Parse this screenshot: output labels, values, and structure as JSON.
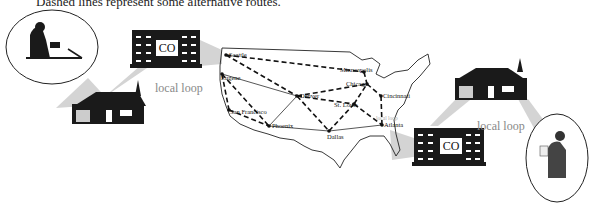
{
  "caption": "Dashed lines represent some alternative routes.",
  "labels": {
    "local_loop_left": "local loop",
    "local_loop_right": "local loop",
    "local_loop_map": "local loop",
    "co_left": "CO",
    "co_right": "CO"
  },
  "cities": [
    {
      "name": "Seattle",
      "x": 226,
      "y": 55
    },
    {
      "name": "Eugene",
      "x": 222,
      "y": 74
    },
    {
      "name": "San Francisco",
      "x": 229,
      "y": 110
    },
    {
      "name": "Phoenix",
      "x": 269,
      "y": 126
    },
    {
      "name": "Denver",
      "x": 297,
      "y": 96
    },
    {
      "name": "Dallas",
      "x": 329,
      "y": 131
    },
    {
      "name": "Minneapolis",
      "x": 364,
      "y": 72
    },
    {
      "name": "Chicago",
      "x": 367,
      "y": 84
    },
    {
      "name": "St. Louis",
      "x": 354,
      "y": 104
    },
    {
      "name": "Cincinnati",
      "x": 381,
      "y": 96
    },
    {
      "name": "Atlanta",
      "x": 382,
      "y": 125
    }
  ],
  "colors": {
    "line": "#222222",
    "wedge": "#d0d0d0",
    "building": "#1a1a1a",
    "loop_text": "#888888"
  }
}
